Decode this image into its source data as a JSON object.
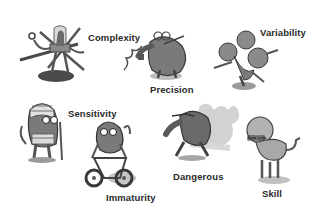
{
  "illustration": {
    "style": "grayscale cartoon monsters",
    "characters": [
      {
        "id": "complexity",
        "label": "Complexity",
        "description": "multi-armed robot-like creature in a glass dome holding tools"
      },
      {
        "id": "precision",
        "label": "Precision",
        "description": "anteater-like creature with goggles holding a coiled wire"
      },
      {
        "id": "variability",
        "label": "Variability",
        "description": "three-headed creature on one leg"
      },
      {
        "id": "sensitivity",
        "label": "Sensitivity",
        "description": "bandaged creature with crutches"
      },
      {
        "id": "immaturity",
        "label": "Immaturity",
        "description": "creature riding a tricycle"
      },
      {
        "id": "dangerous",
        "label": "Dangerous",
        "description": "creature casting a large monstrous shadow"
      },
      {
        "id": "skill",
        "label": "Skill",
        "description": "big-headed creature with glasses and a tail"
      }
    ]
  },
  "colors": {
    "dark": "#4a4a4a",
    "mid": "#7a7a7a",
    "light": "#a8a8a8",
    "shadow": "#cfcfcf",
    "text": "#2a2a2a"
  }
}
